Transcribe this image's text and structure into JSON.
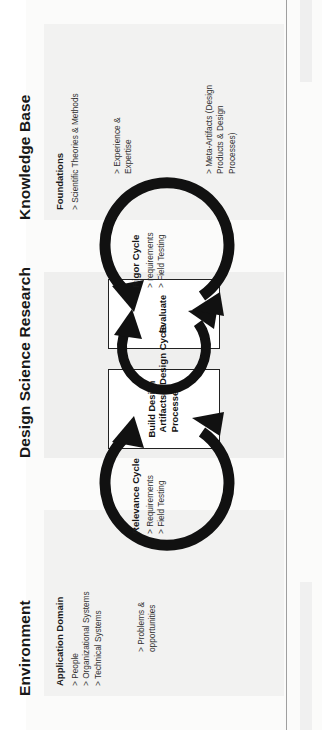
{
  "figure": {
    "orientation": "rotated-90-ccw"
  },
  "columns": {
    "environment": {
      "heading": "Environment",
      "section_heading": "Application Domain",
      "items": "> People\n> Organizational Systems\n> Technical Systems",
      "flow_items": "> Problems &\n   opportunities"
    },
    "design_science_research": {
      "heading": "Design Science Research",
      "build_box": "Build Design\nArtifacts &\nProcesses",
      "evaluate_box": "Evaluate"
    },
    "knowledge_base": {
      "heading": "Knowledge Base",
      "section_heading": "Foundations",
      "items": "> Scientific Theories & Methods",
      "items_2": "> Experience &\n   Expertise",
      "items_3": "> Meta-Artifacts (Design\n   Products & Design\n   Processes)"
    }
  },
  "cycles": {
    "relevance": {
      "label": "Relevance Cycle",
      "sub": "> Requirements\n> Field Testing"
    },
    "design": {
      "label": "Design Cycle",
      "sub": ""
    },
    "rigor": {
      "label": "Rigor Cycle",
      "sub": "> requirements\n> Field Testing"
    }
  },
  "colors": {
    "panel": "#f2f2f1",
    "centre_panel": "#efefee",
    "stroke": "#111111",
    "page": "#ffffff"
  }
}
